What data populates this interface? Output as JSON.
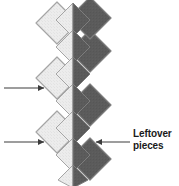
{
  "figure": {
    "type": "quilt-piecing-diagram",
    "background_color": "#ffffff"
  },
  "palette": {
    "light_fill": "#e8e8e8",
    "light_fill_alt": "#ededed",
    "dark_fill": "#5a5a5a",
    "dark_fill_alt": "#555555",
    "outline": "#9a9a9a",
    "seam_white": "#ffffff",
    "arrow_color": "#3c3c3c",
    "text_color": "#1a1a1a"
  },
  "annotations": {
    "leftover": {
      "label_line1": "Leftover",
      "label_line2": "pieces",
      "icon": "arrow-left-icon"
    },
    "left_pointers": [
      {
        "icon": "arrow-right-icon",
        "target": "light-diamond-mid"
      },
      {
        "icon": "arrow-right-icon",
        "target": "light-diamond-lower"
      }
    ]
  },
  "pieces": {
    "columns": [
      {
        "name": "left-column",
        "fill": "light"
      },
      {
        "name": "center-column",
        "fill": "split-light-dark"
      },
      {
        "name": "right-column",
        "fill": "dark"
      }
    ],
    "left_diamonds": 3,
    "center_diamonds": 5,
    "right_diamonds": 3,
    "center_half_triangles": 4
  }
}
